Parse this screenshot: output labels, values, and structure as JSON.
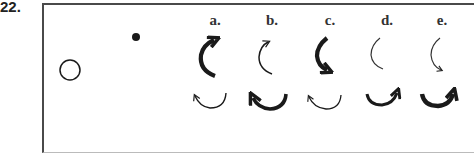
{
  "question_number": "22.",
  "scene": {
    "open_circle": {
      "cx": 70,
      "cy": 70,
      "r": 10
    },
    "filled_dot": {
      "cx": 136,
      "cy": 37,
      "r": 4
    }
  },
  "options": [
    {
      "label": "a.",
      "x": 215
    },
    {
      "label": "b.",
      "x": 272
    },
    {
      "label": "c.",
      "x": 330
    },
    {
      "label": "d.",
      "x": 387
    },
    {
      "label": "e.",
      "x": 442
    }
  ],
  "colors": {
    "ink": "#1a1a1a",
    "frame": "#4a4a4a"
  }
}
